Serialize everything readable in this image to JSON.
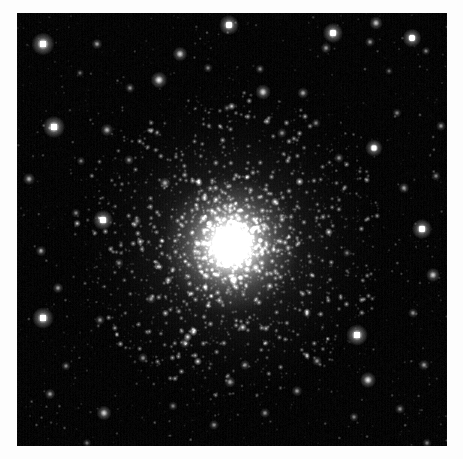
{
  "image": {
    "kind": "astronomical-photograph",
    "subject_label": "globular-star-cluster",
    "width_px": 463,
    "height_px": 459,
    "border": {
      "color": "#fdfdfd",
      "left_px": 17,
      "top_px": 13,
      "right_px": 16,
      "bottom_px": 13
    },
    "field": {
      "x": 17,
      "y": 13,
      "width": 430,
      "height": 433,
      "background_color": "#000000",
      "sky_glow_color": "#0a0a0a"
    }
  },
  "chart_data": {
    "type": "scatter",
    "title": "",
    "subtitle": "",
    "xlabel": "",
    "ylabel": "",
    "grid": false,
    "legend": "none",
    "xlim": [
      0,
      430
    ],
    "ylim": [
      0,
      433
    ],
    "cluster": {
      "name": "globular-cluster",
      "center_x": 214,
      "center_y": 232,
      "core_radius": 26,
      "half_light_radius": 62,
      "halo_radius": 150,
      "core_peak_brightness": 1.0,
      "member_star_count": 2600,
      "core_glow_color": "#ffffff",
      "halo_glow_color": "#cfcfcf"
    },
    "field_stars": [
      {
        "x": 26,
        "y": 31,
        "r": 3.4,
        "b": 0.95
      },
      {
        "x": 80,
        "y": 31,
        "r": 1.6,
        "b": 0.55
      },
      {
        "x": 113,
        "y": 75,
        "r": 1.5,
        "b": 0.5
      },
      {
        "x": 142,
        "y": 67,
        "r": 2.5,
        "b": 0.8
      },
      {
        "x": 163,
        "y": 41,
        "r": 2.2,
        "b": 0.72
      },
      {
        "x": 212,
        "y": 12,
        "r": 3.0,
        "b": 0.9
      },
      {
        "x": 191,
        "y": 55,
        "r": 1.4,
        "b": 0.45
      },
      {
        "x": 243,
        "y": 56,
        "r": 1.4,
        "b": 0.48
      },
      {
        "x": 246,
        "y": 79,
        "r": 2.3,
        "b": 0.74
      },
      {
        "x": 286,
        "y": 80,
        "r": 1.7,
        "b": 0.58
      },
      {
        "x": 309,
        "y": 35,
        "r": 1.6,
        "b": 0.52
      },
      {
        "x": 316,
        "y": 20,
        "r": 3.0,
        "b": 0.92
      },
      {
        "x": 353,
        "y": 29,
        "r": 1.5,
        "b": 0.5
      },
      {
        "x": 359,
        "y": 10,
        "r": 2.0,
        "b": 0.68
      },
      {
        "x": 395,
        "y": 25,
        "r": 2.8,
        "b": 0.88
      },
      {
        "x": 409,
        "y": 38,
        "r": 1.3,
        "b": 0.44
      },
      {
        "x": 37,
        "y": 114,
        "r": 3.3,
        "b": 0.95
      },
      {
        "x": 90,
        "y": 117,
        "r": 1.9,
        "b": 0.62
      },
      {
        "x": 64,
        "y": 148,
        "r": 1.3,
        "b": 0.42
      },
      {
        "x": 112,
        "y": 147,
        "r": 1.5,
        "b": 0.5
      },
      {
        "x": 12,
        "y": 166,
        "r": 1.8,
        "b": 0.6
      },
      {
        "x": 59,
        "y": 200,
        "r": 1.4,
        "b": 0.46
      },
      {
        "x": 24,
        "y": 238,
        "r": 1.6,
        "b": 0.55
      },
      {
        "x": 86,
        "y": 207,
        "r": 3.0,
        "b": 0.9
      },
      {
        "x": 102,
        "y": 250,
        "r": 1.4,
        "b": 0.45
      },
      {
        "x": 41,
        "y": 275,
        "r": 1.6,
        "b": 0.54
      },
      {
        "x": 26,
        "y": 305,
        "r": 3.2,
        "b": 0.93
      },
      {
        "x": 83,
        "y": 307,
        "r": 1.5,
        "b": 0.5
      },
      {
        "x": 49,
        "y": 353,
        "r": 1.4,
        "b": 0.47
      },
      {
        "x": 33,
        "y": 381,
        "r": 1.6,
        "b": 0.55
      },
      {
        "x": 87,
        "y": 400,
        "r": 2.2,
        "b": 0.72
      },
      {
        "x": 126,
        "y": 345,
        "r": 1.5,
        "b": 0.5
      },
      {
        "x": 156,
        "y": 393,
        "r": 1.4,
        "b": 0.45
      },
      {
        "x": 197,
        "y": 412,
        "r": 1.5,
        "b": 0.48
      },
      {
        "x": 213,
        "y": 369,
        "r": 1.7,
        "b": 0.56
      },
      {
        "x": 248,
        "y": 400,
        "r": 1.5,
        "b": 0.5
      },
      {
        "x": 280,
        "y": 378,
        "r": 1.6,
        "b": 0.52
      },
      {
        "x": 300,
        "y": 348,
        "r": 1.5,
        "b": 0.5
      },
      {
        "x": 337,
        "y": 404,
        "r": 1.4,
        "b": 0.46
      },
      {
        "x": 351,
        "y": 367,
        "r": 2.4,
        "b": 0.78
      },
      {
        "x": 383,
        "y": 396,
        "r": 1.5,
        "b": 0.49
      },
      {
        "x": 407,
        "y": 352,
        "r": 1.6,
        "b": 0.53
      },
      {
        "x": 340,
        "y": 322,
        "r": 3.2,
        "b": 0.94
      },
      {
        "x": 396,
        "y": 300,
        "r": 1.5,
        "b": 0.5
      },
      {
        "x": 416,
        "y": 262,
        "r": 2.1,
        "b": 0.7
      },
      {
        "x": 405,
        "y": 216,
        "r": 3.0,
        "b": 0.9
      },
      {
        "x": 387,
        "y": 175,
        "r": 1.6,
        "b": 0.55
      },
      {
        "x": 419,
        "y": 163,
        "r": 1.4,
        "b": 0.46
      },
      {
        "x": 424,
        "y": 113,
        "r": 1.5,
        "b": 0.5
      },
      {
        "x": 380,
        "y": 100,
        "r": 1.4,
        "b": 0.44
      },
      {
        "x": 357,
        "y": 135,
        "r": 2.6,
        "b": 0.84
      },
      {
        "x": 322,
        "y": 145,
        "r": 1.5,
        "b": 0.5
      },
      {
        "x": 299,
        "y": 110,
        "r": 1.4,
        "b": 0.46
      },
      {
        "x": 265,
        "y": 120,
        "r": 1.5,
        "b": 0.48
      },
      {
        "x": 148,
        "y": 170,
        "r": 1.7,
        "b": 0.58
      },
      {
        "x": 120,
        "y": 208,
        "r": 1.4,
        "b": 0.44
      },
      {
        "x": 134,
        "y": 286,
        "r": 1.5,
        "b": 0.48
      },
      {
        "x": 168,
        "y": 330,
        "r": 1.6,
        "b": 0.54
      },
      {
        "x": 228,
        "y": 352,
        "r": 1.5,
        "b": 0.5
      },
      {
        "x": 290,
        "y": 300,
        "r": 1.4,
        "b": 0.45
      },
      {
        "x": 63,
        "y": 60,
        "r": 1.2,
        "b": 0.38
      },
      {
        "x": 140,
        "y": 120,
        "r": 1.2,
        "b": 0.36
      },
      {
        "x": 210,
        "y": 95,
        "r": 1.2,
        "b": 0.38
      },
      {
        "x": 330,
        "y": 240,
        "r": 1.3,
        "b": 0.42
      },
      {
        "x": 372,
        "y": 58,
        "r": 1.2,
        "b": 0.36
      },
      {
        "x": 70,
        "y": 430,
        "r": 1.3,
        "b": 0.4
      },
      {
        "x": 410,
        "y": 430,
        "r": 1.4,
        "b": 0.44
      }
    ]
  },
  "a11y": {
    "alt_text": "Black and white astronomical image of a dense globular star cluster centered in a starfield"
  }
}
